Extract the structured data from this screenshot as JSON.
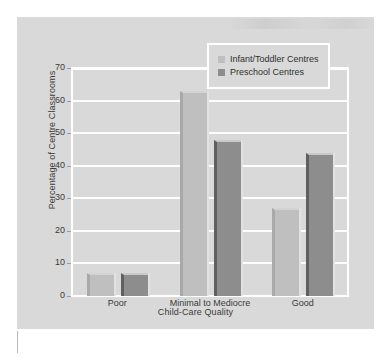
{
  "chart_data": {
    "type": "bar",
    "title": "",
    "subtitle": "",
    "xlabel": "Child-Care Quality",
    "ylabel": "Percentage of Centre Classrooms",
    "categories": [
      "Poor",
      "Minimal to Mediocre",
      "Good"
    ],
    "series": [
      {
        "name": "Infant/Toddler Centres",
        "values": [
          7,
          63,
          27
        ],
        "color": "#bfbfbf"
      },
      {
        "name": "Preschool Centres",
        "values": [
          7,
          48,
          44
        ],
        "color": "#8d8d8d"
      }
    ],
    "ylim": [
      0,
      70
    ],
    "ytick_values": [
      0,
      10,
      20,
      30,
      40,
      50,
      60,
      70
    ],
    "ytick_labels": [
      "0",
      "10",
      "20",
      "30",
      "40",
      "50",
      "60",
      "70"
    ],
    "grid": true,
    "grid_color": "#ffffff",
    "legend_position": "top-right",
    "background_color": "#d9d9d9",
    "page_background": "#ffffff",
    "bar_style": "3d-shadowed"
  },
  "legend": {
    "items": [
      {
        "label": "Infant/Toddler Centres",
        "swatch": "light-gray-swatch"
      },
      {
        "label": "Preschool Centres",
        "swatch": "dark-gray-swatch"
      }
    ]
  }
}
